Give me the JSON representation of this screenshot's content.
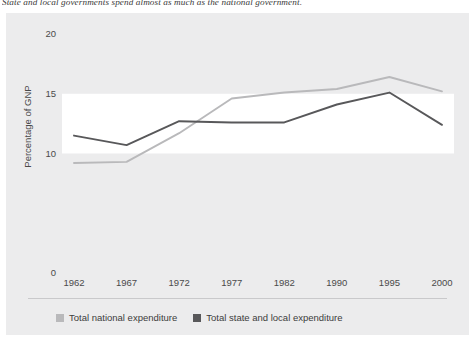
{
  "caption": "State and local governments spend almost as much as the national government.",
  "legend": {
    "items": [
      {
        "label": "Total national expenditure",
        "color": "#b9b9bb",
        "swatch": "legend-swatch-national"
      },
      {
        "label": "Total state and local expenditure",
        "color": "#58585a",
        "swatch": "legend-swatch-state-local"
      }
    ]
  },
  "chart_data": {
    "type": "line",
    "title": "",
    "xlabel": "",
    "ylabel": "Percentage of GNP",
    "categories": [
      "1962",
      "1967",
      "1972",
      "1977",
      "1982",
      "1990",
      "1995",
      "2000"
    ],
    "ytick_labels": [
      "20",
      "15",
      "10",
      "0"
    ],
    "ytick_values": [
      20,
      15,
      10,
      0
    ],
    "ylim": [
      0,
      20
    ],
    "grid": true,
    "legend_position": "bottom-left",
    "series": [
      {
        "name": "Total national expenditure",
        "color": "#b9b9bb",
        "values": [
          9.2,
          9.3,
          11.7,
          14.6,
          15.1,
          15.4,
          16.4,
          15.2
        ]
      },
      {
        "name": "Total state and local expenditure",
        "color": "#58585a",
        "values": [
          11.5,
          10.7,
          12.7,
          12.6,
          12.6,
          14.1,
          15.1,
          12.4
        ]
      }
    ]
  }
}
